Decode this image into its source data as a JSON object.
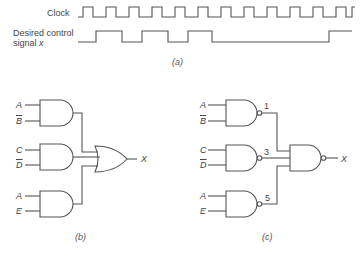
{
  "timing": {
    "clock_label": "Clock",
    "signal_label_line1": "Desired control",
    "signal_label_line2": "signal",
    "signal_var": "x",
    "caption": "(a)"
  },
  "circuit_b": {
    "caption": "(b)",
    "gate_type_inputs": "AND",
    "gate_type_output": "OR",
    "inputs": [
      {
        "top": "A",
        "bottom": "B",
        "bottom_complemented": true
      },
      {
        "top": "C",
        "bottom": "D",
        "bottom_complemented": true
      },
      {
        "top": "A",
        "bottom": "E",
        "bottom_complemented": false
      }
    ],
    "output": "X"
  },
  "circuit_c": {
    "caption": "(c)",
    "gate_type_inputs": "NAND",
    "gate_type_output": "NAND",
    "inputs": [
      {
        "top": "A",
        "bottom": "B",
        "bottom_complemented": true,
        "node": "1"
      },
      {
        "top": "C",
        "bottom": "D",
        "bottom_complemented": true,
        "node": "3"
      },
      {
        "top": "A",
        "bottom": "E",
        "bottom_complemented": false,
        "node": "5"
      }
    ],
    "output": "X"
  },
  "colors": {
    "line": "#555555",
    "background": "#ffffff"
  }
}
